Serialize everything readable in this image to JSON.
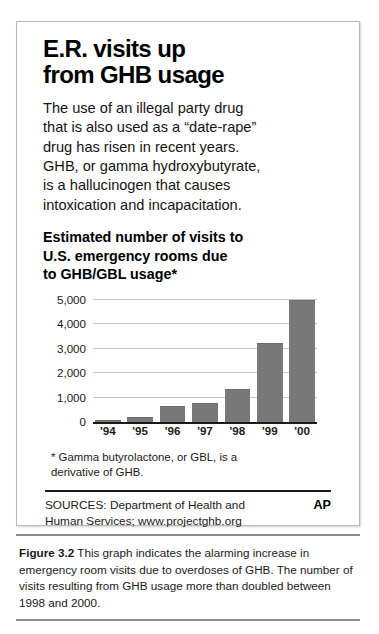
{
  "infographic": {
    "headline_lines": [
      "E.R. visits up",
      "from GHB usage"
    ],
    "lede_lines": [
      "The use of an illegal party drug",
      "that is also used as a “date-rape”",
      "drug has risen in recent years.",
      "GHB, or gamma hydroxybutyrate,",
      "is a hallucinogen that causes",
      "intoxication and incapacitation."
    ],
    "chart_title_lines": [
      "Estimated number of visits to",
      "U.S. emergency rooms due",
      "to GHB/GBL usage*"
    ],
    "footnote_lines": [
      "* Gamma butyrolactone, or GBL, is a",
      "derivative of GHB."
    ],
    "sources_lines": [
      "SOURCES: Department of Health and",
      "Human Services; www.projectghb.org"
    ],
    "ap_credit": "AP"
  },
  "chart_data": {
    "type": "bar",
    "title": "Estimated number of visits to U.S. emergency rooms due to GHB/GBL usage*",
    "xlabel": "",
    "ylabel": "",
    "categories": [
      "'94",
      "'95",
      "'96",
      "'97",
      "'98",
      "'99",
      "'00"
    ],
    "values": [
      55,
      150,
      630,
      750,
      1300,
      3200,
      5000
    ],
    "ylim": [
      0,
      5000
    ],
    "yticks": [
      0,
      1000,
      2000,
      3000,
      4000,
      5000
    ],
    "ytick_labels": [
      "0",
      "1,000",
      "2,000",
      "3,000",
      "4,000",
      "5,000"
    ],
    "grid": true,
    "legend": "none",
    "bar_color": "#787878"
  },
  "caption": {
    "figure_label": "Figure 3.2",
    "text": " This graph indicates the alarming increase in emergency room visits due to overdoses of GHB. The number of visits resulting from GHB usage more than doubled between 1998 and 2000."
  }
}
